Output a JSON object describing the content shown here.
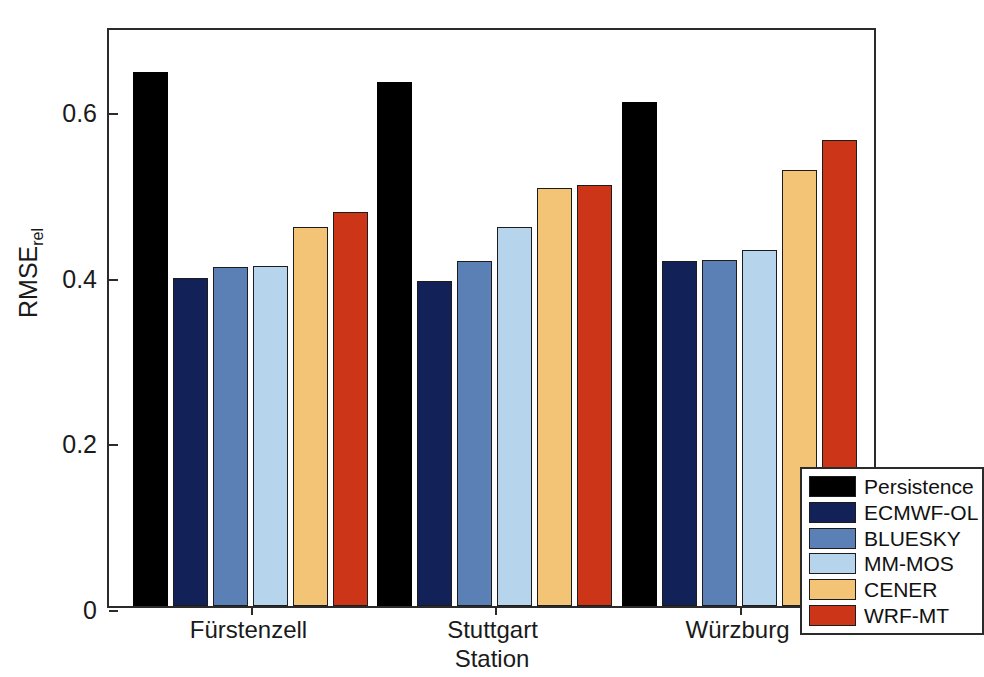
{
  "chart_data": {
    "type": "bar",
    "title": "",
    "xlabel": "Station",
    "ylabel": "RMSErel",
    "ylabel_base": "RMSE",
    "ylabel_sub": "rel",
    "categories": [
      "Fürstenzell",
      "Stuttgart",
      "Würzburg"
    ],
    "ylim": [
      0,
      0.7
    ],
    "ytick_labels": [
      "0",
      "0.2",
      "0.4",
      "0.6"
    ],
    "ytick_values": [
      0,
      0.2,
      0.4,
      0.6
    ],
    "grid": false,
    "legend_position": "lower-right-inside",
    "series": [
      {
        "name": "Persistence",
        "color": "#000000",
        "values": [
          0.645,
          0.633,
          0.608
        ]
      },
      {
        "name": "ECMWF-OL",
        "color": "#122258",
        "values": [
          0.396,
          0.392,
          0.417
        ]
      },
      {
        "name": "BLUESKY",
        "color": "#5b80b5",
        "values": [
          0.409,
          0.416,
          0.418
        ]
      },
      {
        "name": "MM-MOS",
        "color": "#b6d5ed",
        "values": [
          0.41,
          0.457,
          0.43
        ]
      },
      {
        "name": "CENER",
        "color": "#f3c376",
        "values": [
          0.457,
          0.505,
          0.526
        ]
      },
      {
        "name": "WRF-MT",
        "color": "#cc3518",
        "values": [
          0.476,
          0.508,
          0.563
        ]
      }
    ]
  },
  "legend": {
    "items": [
      {
        "label": "Persistence"
      },
      {
        "label": "ECMWF-OL"
      },
      {
        "label": "BLUESKY"
      },
      {
        "label": "MM-MOS"
      },
      {
        "label": "CENER"
      },
      {
        "label": "WRF-MT"
      }
    ]
  },
  "axes": {
    "y_title_base": "RMSE",
    "y_title_sub": "rel",
    "x_title": "Station"
  }
}
